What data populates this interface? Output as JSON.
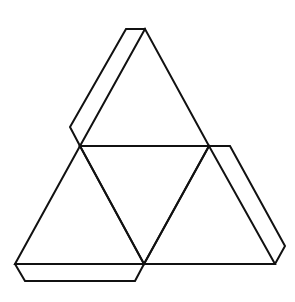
{
  "diagram": {
    "stroke_color": "#111111",
    "background": "#ffffff",
    "vertices": {
      "apex": [
        145,
        29
      ],
      "left": [
        80,
        146
      ],
      "right": [
        209,
        146
      ],
      "bottom_left": [
        15,
        264
      ],
      "bottom_mid": [
        144,
        264
      ],
      "bottom_right": [
        275,
        264
      ]
    },
    "faces": [
      {
        "name": "top-triangle",
        "points": "145,29 80,146 209,146"
      },
      {
        "name": "center-triangle",
        "points": "80,146 209,146 144,264"
      },
      {
        "name": "left-triangle",
        "points": "80,146 15,264 144,264"
      },
      {
        "name": "right-triangle",
        "points": "209,146 144,264 275,264"
      }
    ],
    "tabs": [
      {
        "name": "top-left-tab",
        "points": "145,29 126,29 70,127 80,146"
      },
      {
        "name": "right-tab",
        "points": "209,146 230,146 285,246 275,264"
      },
      {
        "name": "bottom-tab",
        "points": "15,264 25,281 135,281 144,264"
      }
    ]
  }
}
